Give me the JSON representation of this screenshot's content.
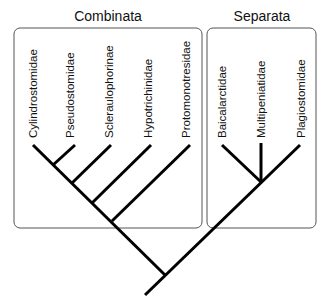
{
  "groups": [
    {
      "name": "Combinata",
      "taxa": [
        "Cylindrostomidae",
        "Pseudostomidae",
        "Scleraulophorinae",
        "Hypotrichinidae",
        "Protomonotresidae"
      ]
    },
    {
      "name": "Separata",
      "taxa": [
        "Baicalarctidae",
        "Multipeniatidae",
        "Plagiostomidae"
      ]
    }
  ],
  "colors": {
    "branch": "#000000",
    "box": "#555555",
    "text": "#111111"
  }
}
